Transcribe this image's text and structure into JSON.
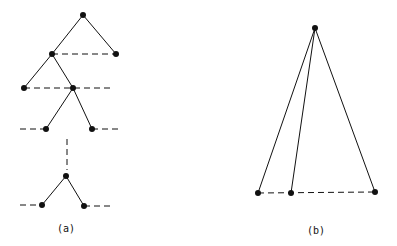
{
  "labels": {
    "a": "(a)",
    "b": "(b)"
  },
  "diagram_a": {
    "nodes": [
      [
        83,
        15
      ],
      [
        52,
        54
      ],
      [
        116,
        54
      ],
      [
        24,
        88
      ],
      [
        73,
        88
      ],
      [
        46,
        129
      ],
      [
        92,
        129
      ],
      [
        66,
        176
      ],
      [
        42,
        205
      ],
      [
        84,
        206
      ]
    ],
    "solid_edges": [
      [
        0,
        1
      ],
      [
        0,
        2
      ],
      [
        1,
        3
      ],
      [
        1,
        4
      ],
      [
        4,
        5
      ],
      [
        4,
        6
      ],
      [
        7,
        8
      ],
      [
        7,
        9
      ]
    ],
    "dashed_lines": [
      [
        [
          52,
          54
        ],
        [
          116,
          54
        ]
      ],
      [
        [
          24,
          88
        ],
        [
          112,
          88
        ]
      ],
      [
        [
          20,
          129
        ],
        [
          46,
          129
        ]
      ],
      [
        [
          92,
          129
        ],
        [
          120,
          129
        ]
      ],
      [
        [
          67,
          139
        ],
        [
          67,
          170
        ]
      ],
      [
        [
          20,
          205
        ],
        [
          42,
          205
        ]
      ],
      [
        [
          84,
          206
        ],
        [
          110,
          206
        ]
      ]
    ]
  },
  "diagram_b": {
    "nodes": [
      [
        315,
        28
      ],
      [
        258,
        193
      ],
      [
        291,
        193
      ],
      [
        375,
        192
      ]
    ],
    "solid_edges": [
      [
        0,
        1
      ],
      [
        0,
        2
      ],
      [
        0,
        3
      ]
    ],
    "dashed_lines": [
      [
        [
          258,
          193
        ],
        [
          375,
          192
        ]
      ]
    ]
  },
  "colors": {
    "ink": "#111111"
  }
}
